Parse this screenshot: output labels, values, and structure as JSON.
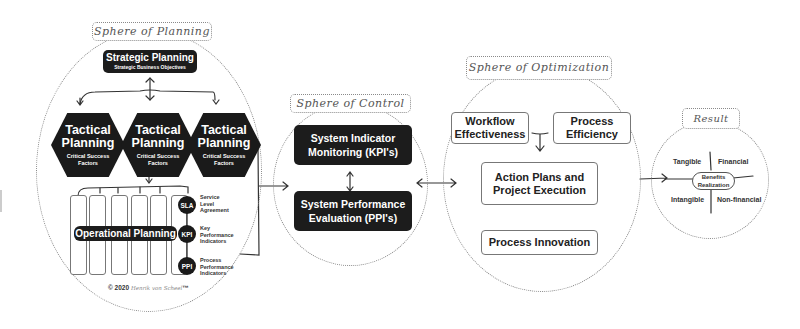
{
  "spheres": {
    "planning": {
      "label": "Sphere of Planning",
      "strategic": {
        "title": "Strategic Planning",
        "subtitle": "Strategic Business Objectives"
      },
      "tactical": [
        {
          "title_line1": "Tactical",
          "title_line2": "Planning",
          "sub_line1": "Critical Success",
          "sub_line2": "Factors"
        },
        {
          "title_line1": "Tactical",
          "title_line2": "Planning",
          "sub_line1": "Critical Success",
          "sub_line2": "Factors"
        },
        {
          "title_line1": "Tactical",
          "title_line2": "Planning",
          "sub_line1": "Critical Success",
          "sub_line2": "Factors"
        }
      ],
      "operational": {
        "title": "Operational Planning"
      },
      "indicators": [
        {
          "abbr": "SLA",
          "line1": "Service",
          "line2": "Level",
          "line3": "Agreement"
        },
        {
          "abbr": "KPI",
          "line1": "Key",
          "line2": "Performance",
          "line3": "Indicators"
        },
        {
          "abbr": "PPI",
          "line1": "Process",
          "line2": "Performance",
          "line3": "Indicators"
        }
      ],
      "copyright": {
        "prefix": "© 2020",
        "author": "Henrik von Scheel",
        "tm": "™"
      }
    },
    "control": {
      "label": "Sphere of Control",
      "box1": {
        "line1": "System Indicator",
        "line2": "Monitoring (KPI's)"
      },
      "box2": {
        "line1": "System Performance",
        "line2": "Evaluation (PPI's)"
      }
    },
    "optimization": {
      "label": "Sphere of Optimization",
      "workflow": {
        "line1": "Workflow",
        "line2": "Effectiveness"
      },
      "efficiency": {
        "line1": "Process",
        "line2": "Efficiency"
      },
      "action": {
        "line1": "Action Plans and",
        "line2": "Project Execution"
      },
      "innovation": {
        "line1": "Process Innovation"
      }
    },
    "result": {
      "label": "Result",
      "center": {
        "line1": "Benefits",
        "line2": "Realization"
      },
      "quadrants": {
        "top_left": "Tangible",
        "top_right": "Financial",
        "bottom_left": "Intangible",
        "bottom_right": "Non-financial"
      }
    }
  },
  "colors": {
    "dark_box": "#1c1c1c",
    "outline": "#8a8a8a",
    "background": "#ffffff"
  }
}
